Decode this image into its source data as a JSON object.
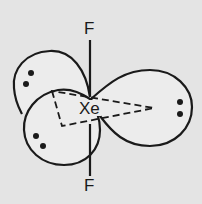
{
  "diagram": {
    "central_atom": "Xe",
    "ligands": [
      {
        "label": "F",
        "position": "top"
      },
      {
        "label": "F",
        "position": "bottom"
      }
    ],
    "lone_pairs": [
      {
        "lobe": "upper-left",
        "electrons": 2
      },
      {
        "lobe": "lower-left",
        "electrons": 2
      },
      {
        "lobe": "right",
        "electrons": 2
      }
    ],
    "colors": {
      "background": "#e4e4e4",
      "lobe_fill": "#ececec",
      "stroke": "#1a1a1a"
    }
  }
}
